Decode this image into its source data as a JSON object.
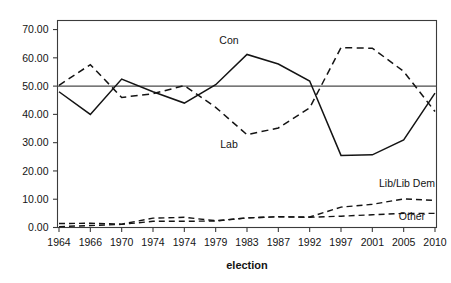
{
  "chart_data": {
    "type": "line",
    "title": "",
    "xlabel": "election",
    "ylabel": "",
    "categories": [
      "1964",
      "1966",
      "1970",
      "1974",
      "1974",
      "1979",
      "1983",
      "1987",
      "1992",
      "1997",
      "2001",
      "2005",
      "2010"
    ],
    "ylim": [
      0,
      73
    ],
    "xlim_note": "categorical, 13 election points evenly spaced",
    "grid": false,
    "legend_position": "inline-annotations",
    "y_ticks": [
      "0.00",
      "10.00",
      "20.00",
      "30.00",
      "40.00",
      "50.00",
      "60.00",
      "70.00"
    ],
    "y_tick_values": [
      0,
      10,
      20,
      30,
      40,
      50,
      60,
      70
    ],
    "reference_line": {
      "y": 50,
      "label": "",
      "style": "solid"
    },
    "series": [
      {
        "name": "Con",
        "style": "solid",
        "label_text": "Con",
        "values": [
          48.0,
          40.0,
          52.5,
          48.0,
          44.0,
          50.5,
          61.2,
          57.8,
          51.8,
          25.5,
          25.7,
          31.0,
          47.5
        ]
      },
      {
        "name": "Lab",
        "style": "dashed",
        "label_text": "Lab",
        "values": [
          50.3,
          57.6,
          46.0,
          47.3,
          50.2,
          42.5,
          32.8,
          35.2,
          42.3,
          63.6,
          63.4,
          55.2,
          41.0
        ]
      },
      {
        "name": "Lib/Lib Dem",
        "style": "dashed",
        "label_text": "Lib/Lib Dem",
        "values": [
          1.4,
          1.5,
          1.2,
          3.3,
          3.6,
          2.4,
          3.4,
          3.8,
          3.7,
          7.2,
          8.2,
          10.1,
          9.6
        ]
      },
      {
        "name": "Other",
        "style": "dashed",
        "label_text": "Other",
        "values": [
          0.3,
          0.7,
          1.1,
          2.2,
          2.2,
          2.3,
          3.4,
          3.8,
          3.6,
          4.0,
          4.5,
          5.0,
          5.0
        ]
      }
    ],
    "colors": {
      "line": "#141414",
      "axis": "#3b3b3b",
      "reference": "#4a4a4a",
      "background": "#ffffff"
    }
  },
  "annotations": {
    "con": "Con",
    "lab": "Lab",
    "libdem": "Lib/Lib Dem",
    "other": "Other"
  },
  "axis": {
    "x_title": "election"
  }
}
